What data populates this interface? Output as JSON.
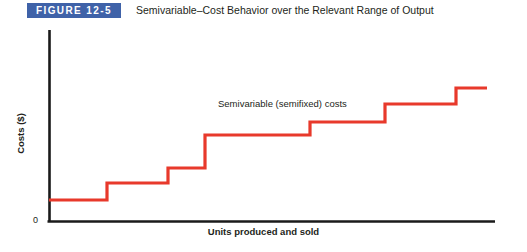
{
  "header": {
    "badge_label": "FIGURE 12-5",
    "title": "Semivariable–Cost Behavior over the Relevant Range of Output",
    "badge_color": "#3f62a8",
    "badge_text_color": "#ffffff"
  },
  "chart_data": {
    "type": "line",
    "title": "Semivariable–Cost Behavior over the Relevant Range of Output",
    "xlabel": "Units produced and sold",
    "ylabel": "Costs ($)",
    "origin_label": "0",
    "grid": false,
    "legend_position": "inline-annotation",
    "annotations": [
      {
        "text": "Semivariable (semifixed) costs",
        "x": 218,
        "y": 74
      }
    ],
    "series": [
      {
        "name": "Semivariable (semifixed) costs",
        "color": "#e8392b",
        "style": "step",
        "step_count": 6,
        "points": [
          {
            "x": 49,
            "y": 176
          },
          {
            "x": 107,
            "y": 176
          },
          {
            "x": 107,
            "y": 159
          },
          {
            "x": 168,
            "y": 159
          },
          {
            "x": 168,
            "y": 144
          },
          {
            "x": 205,
            "y": 144
          },
          {
            "x": 205,
            "y": 111
          },
          {
            "x": 310,
            "y": 111
          },
          {
            "x": 310,
            "y": 98
          },
          {
            "x": 385,
            "y": 98
          },
          {
            "x": 385,
            "y": 80
          },
          {
            "x": 456,
            "y": 80
          },
          {
            "x": 456,
            "y": 64
          },
          {
            "x": 487,
            "y": 64
          }
        ],
        "step_values": [
          1,
          2,
          3,
          4,
          5,
          6,
          7
        ]
      }
    ],
    "axes": {
      "color": "#1a1a1a",
      "y_axis_x": 49,
      "y_axis_top": 6,
      "y_axis_bottom": 198,
      "x_axis_y": 198,
      "x_axis_left": 49,
      "x_axis_right": 495,
      "xlim": [
        0,
        1
      ],
      "ylim": [
        0,
        1
      ],
      "xticks": [],
      "yticks": []
    }
  }
}
